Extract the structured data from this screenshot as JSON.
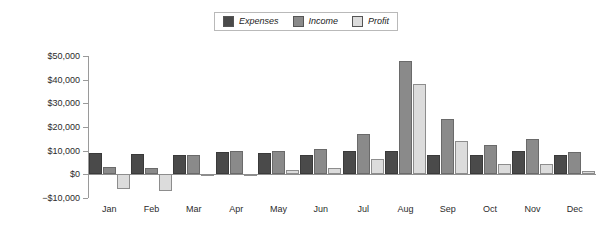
{
  "chart_data": {
    "type": "bar",
    "title": "",
    "xlabel": "",
    "ylabel": "",
    "categories": [
      "Jan",
      "Feb",
      "Mar",
      "Apr",
      "May",
      "Jun",
      "Jul",
      "Aug",
      "Sep",
      "Oct",
      "Nov",
      "Dec"
    ],
    "series": [
      {
        "name": "Expenses",
        "color": "#4a4a4a",
        "values": [
          9000,
          8800,
          8200,
          9500,
          9000,
          8200,
          10000,
          10000,
          8000,
          8000,
          10000,
          8000
        ]
      },
      {
        "name": "Income",
        "color": "#8a8a8a",
        "values": [
          3000,
          2500,
          8000,
          9800,
          9800,
          10500,
          17000,
          48000,
          23500,
          12500,
          15000,
          9500
        ]
      },
      {
        "name": "Profit",
        "color": "#dcdcdc",
        "values": [
          -6000,
          -7000,
          -500,
          -500,
          1800,
          2500,
          6500,
          38000,
          14000,
          4500,
          4500,
          1500
        ]
      }
    ],
    "ylim": [
      -10000,
      50000
    ],
    "ytick_labels": [
      "$50,000",
      "$40,000",
      "$30,000",
      "$20,000",
      "$10,000",
      "$0",
      "−$10,000"
    ],
    "ytick_values": [
      50000,
      40000,
      30000,
      20000,
      10000,
      0,
      -10000
    ],
    "grid": false,
    "legend_position": "top-center"
  }
}
